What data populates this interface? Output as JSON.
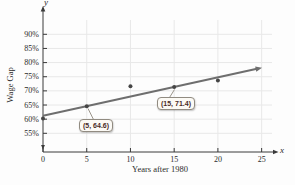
{
  "figure": {
    "y_axis_letter": "y",
    "x_axis_letter": "x",
    "callouts": [
      {
        "label": "(5, 64.6)",
        "x": 5,
        "y": 64.6
      },
      {
        "label": "(15, 71.4)",
        "x": 15,
        "y": 71.4
      }
    ]
  },
  "chart_data": {
    "type": "scatter",
    "title": "",
    "xlabel": "Years after 1980",
    "ylabel": "Wage Gap",
    "x_ticks": [
      0,
      5,
      10,
      15,
      20,
      25
    ],
    "x_tick_labels": [
      "0",
      "5",
      "10",
      "15",
      "20",
      "25"
    ],
    "y_ticks": [
      55,
      60,
      65,
      70,
      75,
      80,
      85,
      90
    ],
    "y_tick_labels": [
      "55%",
      "60%",
      "65%",
      "70%",
      "75%",
      "80%",
      "85%",
      "90%"
    ],
    "xlim": [
      0,
      26.5
    ],
    "ylim": [
      52,
      93
    ],
    "grid": true,
    "legend": "none",
    "scatter_points": [
      [
        0,
        60.2
      ],
      [
        5,
        64.6
      ],
      [
        10,
        71.6
      ],
      [
        15,
        71.4
      ],
      [
        20,
        73.7
      ]
    ],
    "labeled_points": [
      {
        "x": 5,
        "y": 64.6,
        "label": "(5, 64.6)"
      },
      {
        "x": 15,
        "y": 71.4,
        "label": "(15, 71.4)"
      }
    ],
    "trend_line": {
      "x_start": 0,
      "y_start": 61.2,
      "x_end": 24.6,
      "y_end": 77.9,
      "arrow_end": true
    },
    "colors": {
      "trend_line": "#6e6e6e",
      "data_point": "#454545",
      "axis": "#3a3a3a",
      "grid": "#e8e8e8",
      "text": "#2b2b2b",
      "callout_bg": "#fcfaf5",
      "callout_border": "#918b81",
      "callout_text": "#4a2c28"
    }
  }
}
